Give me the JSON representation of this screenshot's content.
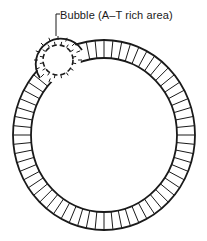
{
  "diagram": {
    "type": "circular-dna-replication-bubble",
    "annotation": {
      "label": "Bubble (A–T rich area)"
    },
    "colors": {
      "stroke": "#1a1a1a",
      "background": "#ffffff"
    }
  }
}
